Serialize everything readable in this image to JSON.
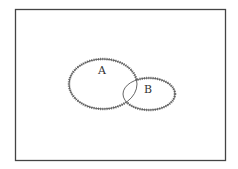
{
  "diagram": {
    "type": "venn",
    "universe": {
      "label": ""
    },
    "sets": [
      {
        "id": "A",
        "label": "A",
        "shape": "ellipse",
        "cx": 103,
        "cy": 84,
        "rx": 34,
        "ry": 25
      },
      {
        "id": "B",
        "label": "B",
        "shape": "ellipse",
        "cx": 149,
        "cy": 94,
        "rx": 26,
        "ry": 16
      }
    ],
    "relationship": "A and B overlap (partial intersection)",
    "boundary_style": "outer boundary of A ∪ B drawn with serrated/hatched edge; inner arcs plain",
    "colors": {
      "line": "#555555",
      "border": "#444444",
      "background": "#ffffff"
    }
  }
}
